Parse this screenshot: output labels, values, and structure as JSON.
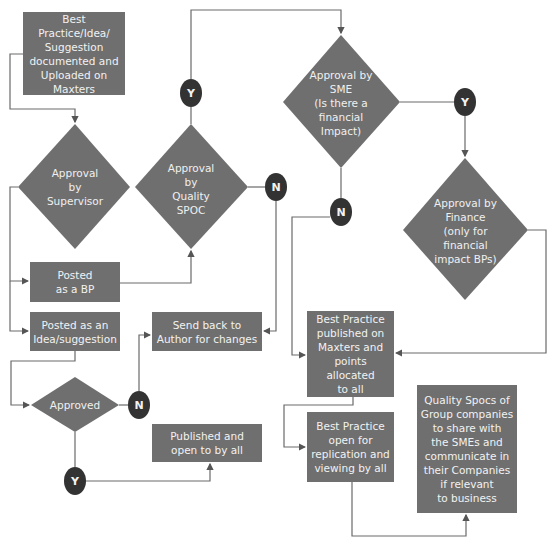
{
  "colors": {
    "node_fill": "#6f6f6f",
    "node_text": "#f2f2f2",
    "decision_badge": "#333333",
    "line": "#666666"
  },
  "nodes": {
    "uploaded": "Best Practice/Idea/\nSuggestion\ndocumented and\nUploaded on\nMaxters",
    "supervisor": "Approval\nby\nSupervisor",
    "quality_spoc": "Approval\nby\nQuality\nSPOC",
    "sme": "Approval by\nSME\n(Is there a\nfinancial\nImpact)",
    "finance": "Approval by\nFinance\n(only for\nfinancial\nimpact BPs)",
    "posted_bp": "Posted\nas a BP",
    "posted_idea": "Posted as an\nIdea/suggestion",
    "send_back": "Send back to\nAuthor for changes",
    "approved": "Approved",
    "published_open": "Published and\nopen to by all",
    "bp_published": "Best Practice\npublished on\nMaxters and\npoints allocated\nto all",
    "bp_open": "Best Practice\nopen for\nreplication and\nviewing by all",
    "quality_spocs_share": "Quality Spocs of\nGroup companies\nto share with\nthe SMEs and\ncommunicate in\ntheir Companies\nif relevant\nto business"
  },
  "badges": {
    "qspoc_yes": "Y",
    "qspoc_no": "N",
    "sme_yes": "Y",
    "sme_no": "N",
    "approved_no": "N",
    "approved_yes": "Y"
  }
}
